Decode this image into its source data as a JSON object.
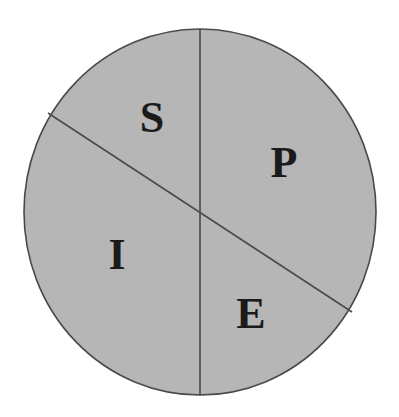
{
  "figure": {
    "name": "partitioned-circle-diagram",
    "background_color": "#ffffff",
    "canvas": {
      "width": 399,
      "height": 417
    }
  },
  "shape": {
    "type": "circle",
    "fill_color": "#b6b6b6",
    "stroke_color": "#4a4a4a",
    "stroke_width": 1.6,
    "center": {
      "x": 200,
      "y": 212
    },
    "radius_x": 176,
    "radius_y": 183
  },
  "dividers": [
    {
      "name": "vertical-diameter",
      "kind": "diameter",
      "orientation": "vertical",
      "x1": 200,
      "y1": 29,
      "x2": 200,
      "y2": 395,
      "stroke_color": "#4a4a4a",
      "stroke_width": 1.6
    },
    {
      "name": "diagonal-chord",
      "kind": "diameter",
      "orientation": "diagonal",
      "x1": 48,
      "y1": 113,
      "x2": 352,
      "y2": 312,
      "stroke_color": "#4a4a4a",
      "stroke_width": 1.6
    }
  ],
  "labels": [
    {
      "text": "S",
      "x": 152,
      "y": 117,
      "font_size": 44,
      "color": "#1b1b1b",
      "region": "upper-left"
    },
    {
      "text": "P",
      "x": 284,
      "y": 162,
      "font_size": 44,
      "color": "#1b1b1b",
      "region": "upper-right"
    },
    {
      "text": "I",
      "x": 117,
      "y": 254,
      "font_size": 44,
      "color": "#1b1b1b",
      "region": "lower-left"
    },
    {
      "text": "E",
      "x": 251,
      "y": 313,
      "font_size": 44,
      "color": "#1b1b1b",
      "region": "lower-right"
    }
  ],
  "chart_data": {
    "type": "pie",
    "title": "",
    "subtitle": "",
    "xlabel": "",
    "ylabel": "",
    "legend_position": "none",
    "grid": false,
    "note": "Circle divided by two full diameters (one vertical, one diagonal) into four labelled regions.",
    "categories": [
      "S",
      "P",
      "I",
      "E"
    ],
    "values": [
      25,
      25,
      25,
      25
    ],
    "value_unit": "percent",
    "slice_fill": "#b6b6b6",
    "slice_stroke": "#4a4a4a"
  }
}
